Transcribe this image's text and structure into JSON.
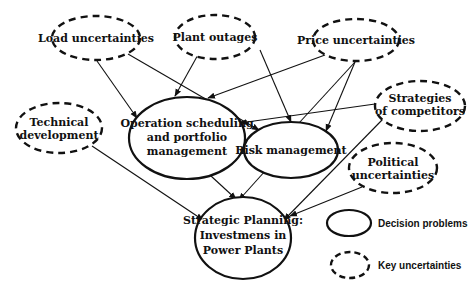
{
  "diagram": {
    "nodes": {
      "load": {
        "lines": [
          "Load uncertainties"
        ],
        "type": "key-uncertainty"
      },
      "plant": {
        "lines": [
          "Plant outages"
        ],
        "type": "key-uncertainty"
      },
      "price": {
        "lines": [
          "Price uncertainties"
        ],
        "type": "key-uncertainty"
      },
      "strategies": {
        "lines": [
          "Strategies",
          "of competitors"
        ],
        "type": "key-uncertainty"
      },
      "technical": {
        "lines": [
          "Technical",
          "development"
        ],
        "type": "key-uncertainty"
      },
      "operation": {
        "lines": [
          "Operation scheduling",
          "and portfolio",
          "management"
        ],
        "type": "decision-problem"
      },
      "risk": {
        "lines": [
          "Risk management"
        ],
        "type": "decision-problem"
      },
      "political": {
        "lines": [
          "Political",
          "uncertainties"
        ],
        "type": "key-uncertainty"
      },
      "strategic": {
        "lines": [
          "Strategic Planning:",
          "Investmens in",
          "Power Plants"
        ],
        "type": "decision-problem"
      }
    },
    "edges": [
      {
        "from": "load",
        "to": "operation"
      },
      {
        "from": "load",
        "to": "risk"
      },
      {
        "from": "plant",
        "to": "operation"
      },
      {
        "from": "plant",
        "to": "risk"
      },
      {
        "from": "price",
        "to": "operation"
      },
      {
        "from": "price",
        "to": "risk"
      },
      {
        "from": "price",
        "to": "risk"
      },
      {
        "from": "strategies",
        "to": "operation"
      },
      {
        "from": "strategies",
        "to": "strategic"
      },
      {
        "from": "technical",
        "to": "strategic"
      },
      {
        "from": "operation",
        "to": "risk"
      },
      {
        "from": "operation",
        "to": "strategic"
      },
      {
        "from": "risk",
        "to": "strategic"
      },
      {
        "from": "political",
        "to": "strategic"
      }
    ],
    "legend": {
      "decision": "Decision problems",
      "uncertainty": "Key uncertainties"
    },
    "colors": {
      "stroke": "#111111",
      "background": "#ffffff"
    }
  }
}
